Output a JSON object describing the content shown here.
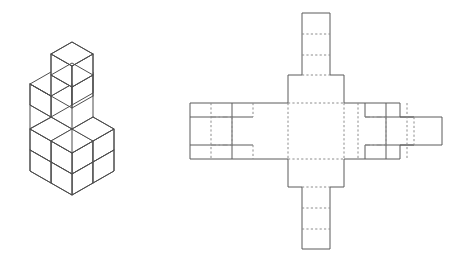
{
  "document": {
    "title": "Isometric stepped cube solid and its unfolded net",
    "background_color": "#ffffff",
    "width": 459,
    "height": 263
  },
  "style": {
    "solid_edge_color": "#5a5a5a",
    "iso_edge_color": "#4d4d4d",
    "fold_line_color": "#8c8c8c",
    "face_fill": "#ffffff",
    "stroke_width": 1,
    "dash_pattern": "2.2 2.2",
    "dashdot_pattern": "5 2.5 1.6 2.5"
  },
  "figures": [
    {
      "id": "isometric-solid",
      "name": "isometric-stepped-cube-solid",
      "label": "3D stepped cube stack",
      "projection": "isometric",
      "grid": "3x3x3",
      "cube_unit_px": 21,
      "origin": {
        "x": 72,
        "y": 174
      },
      "description": "Stepped pyramid of unit cubes on a 3x3 base",
      "layers": [
        {
          "level": 0,
          "label": "bottom-layer",
          "cubes": 9,
          "shape": "3x3 full"
        },
        {
          "level": 1,
          "label": "middle-layer",
          "cubes": 4,
          "shape": "2x2 corner"
        },
        {
          "level": 2,
          "label": "top-layer",
          "cubes": 1,
          "shape": "1x1 corner"
        }
      ]
    },
    {
      "id": "net-diagram",
      "name": "unfolded-net-diagram",
      "label": "2D net / unfolding pattern",
      "unit_px": 28,
      "center": {
        "x": 316,
        "y": 131
      },
      "parts": [
        {
          "name": "center-square",
          "label": "center face"
        },
        {
          "name": "top-flap",
          "label": "top flap"
        },
        {
          "name": "top-stem",
          "label": "top stem strip"
        },
        {
          "name": "bottom-flap",
          "label": "bottom flap"
        },
        {
          "name": "bottom-stem",
          "label": "bottom stem strip"
        },
        {
          "name": "left-wing",
          "label": "left wing panel"
        },
        {
          "name": "right-wing",
          "label": "right wing panel"
        },
        {
          "name": "right-tab",
          "label": "right edge tab"
        }
      ]
    }
  ]
}
